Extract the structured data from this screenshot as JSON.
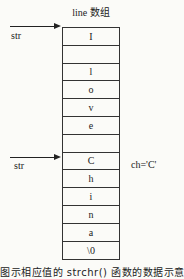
{
  "diagram": {
    "title": "line 数组",
    "cells": [
      "I",
      "",
      "l",
      "o",
      "v",
      "e",
      "",
      "C",
      "h",
      "i",
      "n",
      "a",
      "\\0"
    ],
    "pointers": [
      {
        "label": "str",
        "target_index": 0
      },
      {
        "label": "str",
        "target_index": 7
      }
    ],
    "annotation": {
      "text": "ch='C'",
      "target_index": 7
    },
    "caption": "图示相应值的 strchr() 函数的数据示意"
  }
}
